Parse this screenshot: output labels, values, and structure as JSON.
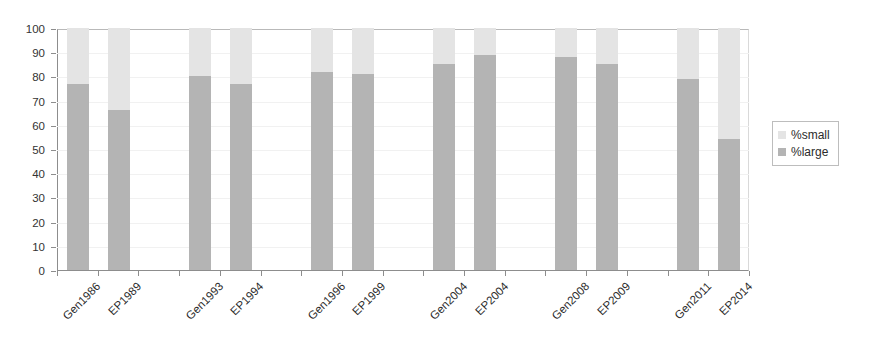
{
  "chart_data": {
    "type": "bar",
    "stacked": true,
    "title": "",
    "xlabel": "",
    "ylabel": "",
    "ylim": [
      0,
      100
    ],
    "yticks": [
      0,
      10,
      20,
      30,
      40,
      50,
      60,
      70,
      80,
      90,
      100
    ],
    "grid": true,
    "legend_position": "right",
    "categories": [
      "Gen1986",
      "EP1989",
      "",
      "Gen1993",
      "EP1994",
      "",
      "Gen1996",
      "EP1999",
      "",
      "Gen2004",
      "EP2004",
      "",
      "Gen2008",
      "EP2009",
      "",
      "Gen2011",
      "EP2014"
    ],
    "series": [
      {
        "name": "%large",
        "color": "#b4b4b4",
        "values": [
          77,
          66,
          null,
          80,
          77,
          null,
          82,
          81,
          null,
          85,
          89,
          null,
          88,
          85,
          null,
          79,
          54
        ]
      },
      {
        "name": "%small",
        "color": "#e4e4e4",
        "values": [
          23,
          34,
          null,
          20,
          23,
          null,
          18,
          19,
          null,
          15,
          11,
          null,
          12,
          15,
          null,
          21,
          46
        ]
      }
    ]
  },
  "legend": {
    "items": [
      {
        "label": "%small",
        "swatch": "legend-swatch-small"
      },
      {
        "label": "%large",
        "swatch": "legend-swatch-large"
      }
    ]
  },
  "colors": {
    "small": "#e4e4e4",
    "large": "#b4b4b4",
    "axis": "#8d8d8d",
    "grid": "#f1f1f1",
    "text": "#2b2b2b"
  }
}
